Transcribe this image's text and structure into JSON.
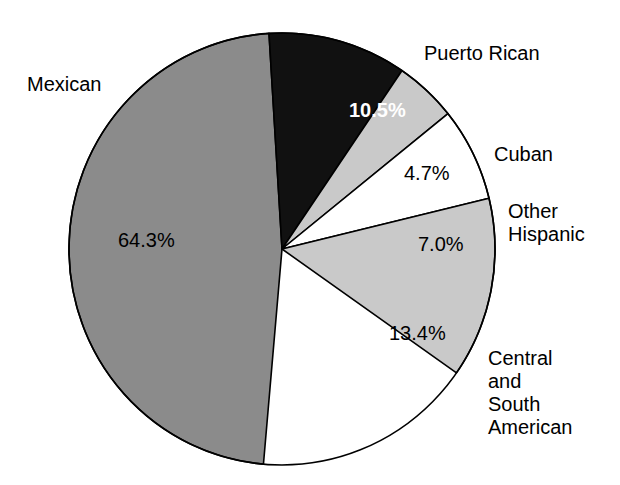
{
  "chart_data": {
    "type": "pie",
    "title": "",
    "subtitle": "",
    "xlabel": "",
    "ylabel": "",
    "legend_position": "outside-labels",
    "grid": false,
    "units": "percent",
    "total": 99.9,
    "categories": [
      "Mexican",
      "Puerto Rican",
      "Cuban",
      "Other Hispanic",
      "Central and South American"
    ],
    "values": [
      64.3,
      10.5,
      4.7,
      7.0,
      13.4
    ],
    "value_labels": [
      "64.3%",
      "10.5%",
      "4.7%",
      "7.0%",
      "13.4%"
    ],
    "slice_colors": [
      "#8b8b8b",
      "#111111",
      "#c9c9c9",
      "#ffffff",
      "#c9c9c9"
    ],
    "slices": [
      {
        "name": "Mexican",
        "label": "Mexican",
        "value": 64.3,
        "value_label": "64.3%",
        "color": "#8b8b8b",
        "label_color": "#000000",
        "start_angle": 185.0,
        "end_angle": 356.5
      },
      {
        "name": "Puerto Rican",
        "label": "Puerto Rican",
        "value": 10.5,
        "value_label": "10.5%",
        "color": "#111111",
        "label_color": "#ffffff",
        "start_angle": 356.5,
        "end_angle": 34.3
      },
      {
        "name": "Cuban",
        "label": "Cuban",
        "value": 4.7,
        "value_label": "4.7%",
        "color": "#c9c9c9",
        "label_color": "#000000",
        "start_angle": 34.3,
        "end_angle": 51.2
      },
      {
        "name": "Other Hispanic",
        "label": "Other\nHispanic",
        "label_line1": "Other",
        "label_line2": "Hispanic",
        "value": 7.0,
        "value_label": "7.0%",
        "color": "#ffffff",
        "label_color": "#000000",
        "start_angle": 51.2,
        "end_angle": 76.4
      },
      {
        "name": "Central and South American",
        "label": "Central\nand\nSouth\nAmerican",
        "label_line1": "Central",
        "label_line2": "and",
        "label_line3": "South",
        "label_line4": "American",
        "value": 13.4,
        "value_label": "13.4%",
        "color": "#c9c9c9",
        "label_color": "#000000",
        "start_angle": 76.4,
        "end_angle": 125.0
      }
    ],
    "geometry": {
      "center_x": 282,
      "center_y": 249,
      "radius_x": 213,
      "radius_y": 216,
      "stroke_color": "#000000",
      "stroke_width": 1.6,
      "background": "#ffffff"
    }
  }
}
